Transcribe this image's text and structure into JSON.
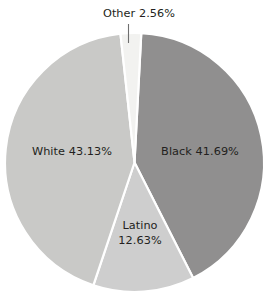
{
  "chart_data": {
    "type": "pie",
    "title": "",
    "subtitle": "",
    "xlabel": "",
    "ylabel": "",
    "grid": false,
    "legend_position": "none",
    "labels_inside": true,
    "start_angle_deg": 3,
    "direction": "clockwise",
    "categories": [
      "Black",
      "Latino",
      "White",
      "Other"
    ],
    "values": [
      41.69,
      12.63,
      43.13,
      2.56
    ],
    "value_unit": "%",
    "colors": [
      "#908f8f",
      "#cecece",
      "#c9c9c7",
      "#f2f2f0"
    ],
    "separator_color": "#ffffff",
    "background_color": "#ffffff",
    "text_color": "#231f20",
    "leader_line_color": "#6f6f6f",
    "slices": [
      {
        "name": "Black",
        "value": 41.69,
        "label": "Black 41.69%",
        "color": "#908f8f",
        "label_placement": "inside"
      },
      {
        "name": "Latino",
        "value": 12.63,
        "label_line1": "Latino",
        "label_line2": "12.63%",
        "color": "#cecece",
        "label_placement": "inside"
      },
      {
        "name": "White",
        "value": 43.13,
        "label": "White 43.13%",
        "color": "#c9c9c7",
        "label_placement": "inside"
      },
      {
        "name": "Other",
        "value": 2.56,
        "label": "Other 2.56%",
        "color": "#f2f2f0",
        "label_placement": "outside-top",
        "has_leader_line": true
      }
    ]
  }
}
